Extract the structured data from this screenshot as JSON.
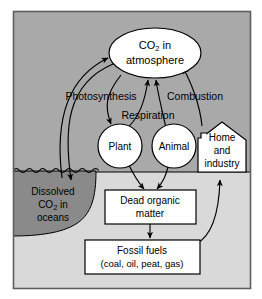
{
  "figure": {
    "background_upper": "#a9a9a9",
    "background_lower": "#d9d9d9",
    "ocean_fill": "#8a8a8a",
    "node_fill": "#ffffff",
    "stroke": "#000000",
    "frame": "#6e6e6e"
  },
  "nodes": {
    "atmosphere": {
      "shape": "ellipse",
      "line1_pre": "CO",
      "line1_sub": "2",
      "line1_post": " in",
      "line2": "atmosphere"
    },
    "plant": {
      "shape": "circle",
      "label": "Plant"
    },
    "animal": {
      "shape": "circle",
      "label": "Animal"
    },
    "home": {
      "shape": "house",
      "line1": "Home",
      "line2": "and",
      "line3": "industry"
    },
    "ocean": {
      "shape": "ocean-region",
      "line1": "Dissolved",
      "line2_pre": "CO",
      "line2_sub": "2",
      "line2_post": " in",
      "line3": "oceans"
    },
    "dead_organic_matter": {
      "shape": "rect",
      "line1": "Dead organic",
      "line2": "matter"
    },
    "fossil_fuels": {
      "shape": "rect",
      "line1": "Fossil fuels",
      "line2": "(coal, oil, peat, gas)"
    }
  },
  "process_labels": {
    "photosynthesis": "Photosynthesis",
    "respiration": "Respiration",
    "combustion": "Combustion"
  },
  "flows": [
    {
      "name": "ocean-to-atmosphere",
      "from": "ocean",
      "to": "atmosphere",
      "label": ""
    },
    {
      "name": "atmosphere-to-ocean",
      "from": "atmosphere",
      "to": "ocean",
      "label": ""
    },
    {
      "name": "atmosphere-to-plant",
      "from": "atmosphere",
      "to": "plant",
      "label": "Photosynthesis"
    },
    {
      "name": "plant-to-atmosphere",
      "from": "plant",
      "to": "atmosphere",
      "label": "Respiration"
    },
    {
      "name": "animal-to-atmosphere",
      "from": "animal",
      "to": "atmosphere",
      "label": "Respiration"
    },
    {
      "name": "home-to-atmosphere",
      "from": "home",
      "to": "atmosphere",
      "label": "Combustion"
    },
    {
      "name": "plant-to-dead-organic-matter",
      "from": "plant",
      "to": "dead_organic_matter",
      "label": ""
    },
    {
      "name": "animal-to-dead-organic-matter",
      "from": "animal",
      "to": "dead_organic_matter",
      "label": ""
    },
    {
      "name": "dead-organic-matter-to-fossil-fuels",
      "from": "dead_organic_matter",
      "to": "fossil_fuels",
      "label": ""
    },
    {
      "name": "fossil-fuels-to-home",
      "from": "fossil_fuels",
      "to": "home",
      "label": ""
    }
  ]
}
